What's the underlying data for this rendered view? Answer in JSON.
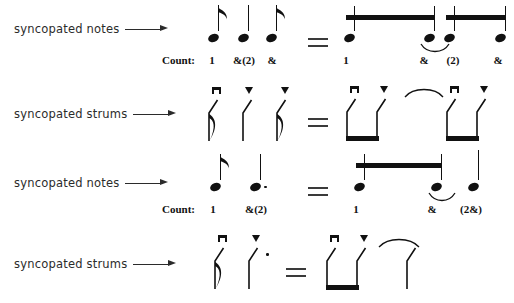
{
  "figure": {
    "background": "#ffffff",
    "ink": "#111111"
  },
  "rows": [
    {
      "id": "row-1",
      "label": "syncopated notes",
      "arrow_icon": "right-arrow-icon",
      "equals": "=",
      "count_label": "Count:",
      "left_counts": [
        "1",
        "&(2)",
        "&"
      ],
      "right_counts": [
        "1",
        "&",
        "(2)",
        "&"
      ],
      "left_notation": "eighth note, quarter note, eighth note",
      "right_notation": "two beamed eighths, tied to two beamed eighths",
      "has_tie": true
    },
    {
      "id": "row-2",
      "label": "syncopated strums",
      "arrow_icon": "right-arrow-icon",
      "equals": "=",
      "left_strokes": [
        "down",
        "up",
        "up"
      ],
      "right_strokes": [
        "down",
        "up",
        "down",
        "up"
      ],
      "left_notation": "eighth down strum, quarter up strum, eighth up strum",
      "right_notation": "beamed down-up pair, tie, beamed down-up pair",
      "has_tie": true
    },
    {
      "id": "row-3",
      "label": "syncopated notes",
      "arrow_icon": "right-arrow-icon",
      "equals": "=",
      "count_label": "Count:",
      "left_counts": [
        "1",
        "&(2)"
      ],
      "right_counts": [
        "1",
        "&",
        "(2&)"
      ],
      "left_notation": "eighth note, dotted quarter note",
      "right_notation": "two beamed eighths tied to a quarter note",
      "has_tie": true
    },
    {
      "id": "row-4",
      "label": "syncopated strums",
      "arrow_icon": "right-arrow-icon",
      "equals": "=",
      "left_strokes": [
        "down",
        "up"
      ],
      "right_strokes": [
        "down",
        "up",
        "up"
      ],
      "left_notation": "eighth down strum, dotted quarter up strum",
      "right_notation": "beamed down-up pair tied to quarter up strum",
      "has_tie": true
    }
  ]
}
